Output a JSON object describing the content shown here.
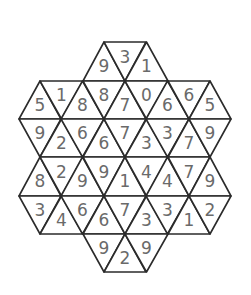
{
  "puzzle": {
    "type": "triangular-grid-number-puzzle",
    "shape": "seven-hexagon cluster (top hex, bottom hex, left/right hex pairs, center)",
    "colors": {
      "line": "#2b2b2b",
      "ink": "#6a6a6a",
      "background": "#ffffff"
    },
    "geometry": {
      "row_tops": [
        42,
        81,
        119,
        157,
        196,
        234
      ],
      "row_height": 38.5,
      "x_vertices": [
        19,
        40,
        61,
        83,
        104,
        125,
        146,
        168,
        189,
        210,
        231
      ]
    },
    "rows": [
      {
        "name": "row-a",
        "y_top": 42,
        "y_bottom": 81,
        "cells": [
          {
            "dir": "up",
            "x0": 83,
            "x1": 125,
            "value": "9"
          },
          {
            "dir": "down",
            "x0": 104,
            "x1": 146,
            "value": "3"
          },
          {
            "dir": "up",
            "x0": 125,
            "x1": 168,
            "value": "1"
          }
        ]
      },
      {
        "name": "row-b",
        "y_top": 81,
        "y_bottom": 119,
        "cells": [
          {
            "dir": "up",
            "x0": 19,
            "x1": 61,
            "value": "5"
          },
          {
            "dir": "down",
            "x0": 40,
            "x1": 83,
            "value": "1"
          },
          {
            "dir": "up",
            "x0": 61,
            "x1": 104,
            "value": "8"
          },
          {
            "dir": "down",
            "x0": 83,
            "x1": 125,
            "value": "8"
          },
          {
            "dir": "up",
            "x0": 104,
            "x1": 146,
            "value": "7"
          },
          {
            "dir": "down",
            "x0": 125,
            "x1": 168,
            "value": "0"
          },
          {
            "dir": "up",
            "x0": 146,
            "x1": 189,
            "value": "6"
          },
          {
            "dir": "down",
            "x0": 168,
            "x1": 210,
            "value": "6"
          },
          {
            "dir": "up",
            "x0": 189,
            "x1": 231,
            "value": "5"
          }
        ]
      },
      {
        "name": "row-c",
        "y_top": 119,
        "y_bottom": 157,
        "cells": [
          {
            "dir": "down",
            "x0": 19,
            "x1": 61,
            "value": "9"
          },
          {
            "dir": "up",
            "x0": 40,
            "x1": 83,
            "value": "2"
          },
          {
            "dir": "down",
            "x0": 61,
            "x1": 104,
            "value": "6"
          },
          {
            "dir": "up",
            "x0": 83,
            "x1": 125,
            "value": "6"
          },
          {
            "dir": "down",
            "x0": 104,
            "x1": 146,
            "value": "7"
          },
          {
            "dir": "up",
            "x0": 125,
            "x1": 168,
            "value": "3"
          },
          {
            "dir": "down",
            "x0": 146,
            "x1": 189,
            "value": "3"
          },
          {
            "dir": "up",
            "x0": 168,
            "x1": 210,
            "value": "7"
          },
          {
            "dir": "down",
            "x0": 189,
            "x1": 231,
            "value": "9"
          }
        ]
      },
      {
        "name": "row-d",
        "y_top": 157,
        "y_bottom": 196,
        "cells": [
          {
            "dir": "up",
            "x0": 19,
            "x1": 61,
            "value": "8"
          },
          {
            "dir": "down",
            "x0": 40,
            "x1": 83,
            "value": "2"
          },
          {
            "dir": "up",
            "x0": 61,
            "x1": 104,
            "value": "9"
          },
          {
            "dir": "down",
            "x0": 83,
            "x1": 125,
            "value": "9"
          },
          {
            "dir": "up",
            "x0": 104,
            "x1": 146,
            "value": "1"
          },
          {
            "dir": "down",
            "x0": 125,
            "x1": 168,
            "value": "4"
          },
          {
            "dir": "up",
            "x0": 146,
            "x1": 189,
            "value": "4"
          },
          {
            "dir": "down",
            "x0": 168,
            "x1": 210,
            "value": "7"
          },
          {
            "dir": "up",
            "x0": 189,
            "x1": 231,
            "value": "9"
          }
        ]
      },
      {
        "name": "row-e",
        "y_top": 196,
        "y_bottom": 234,
        "cells": [
          {
            "dir": "down",
            "x0": 19,
            "x1": 61,
            "value": "3"
          },
          {
            "dir": "up",
            "x0": 40,
            "x1": 83,
            "value": "4"
          },
          {
            "dir": "down",
            "x0": 61,
            "x1": 104,
            "value": "6"
          },
          {
            "dir": "up",
            "x0": 83,
            "x1": 125,
            "value": "6"
          },
          {
            "dir": "down",
            "x0": 104,
            "x1": 146,
            "value": "7"
          },
          {
            "dir": "up",
            "x0": 125,
            "x1": 168,
            "value": "3"
          },
          {
            "dir": "down",
            "x0": 146,
            "x1": 189,
            "value": "3"
          },
          {
            "dir": "up",
            "x0": 168,
            "x1": 210,
            "value": "1"
          },
          {
            "dir": "down",
            "x0": 189,
            "x1": 231,
            "value": "2"
          }
        ]
      },
      {
        "name": "row-f",
        "y_top": 234,
        "y_bottom": 272,
        "cells": [
          {
            "dir": "down",
            "x0": 83,
            "x1": 125,
            "value": "9"
          },
          {
            "dir": "up",
            "x0": 104,
            "x1": 146,
            "value": "2"
          },
          {
            "dir": "down",
            "x0": 125,
            "x1": 168,
            "value": "9"
          }
        ]
      }
    ]
  }
}
